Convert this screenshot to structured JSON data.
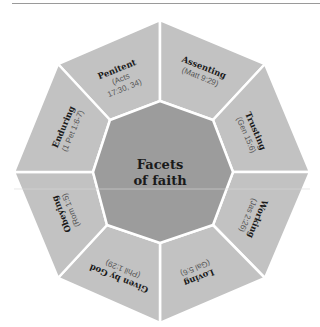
{
  "diagram": {
    "center": {
      "line1": "Facets",
      "line2": "of faith"
    },
    "colors": {
      "outer": "#c2c2c2",
      "inner": "#9c9c9c",
      "divider": "#ffffff",
      "title_text": "#1a1a1a",
      "ref_text": "#555555"
    },
    "facets": [
      {
        "title": "Penitent",
        "ref_line1": "(Acts",
        "ref_line2": "17:30, 34)"
      },
      {
        "title": "Assenting",
        "ref_line1": "(Matt 9:29)"
      },
      {
        "title": "Trusting",
        "ref_line1": "(Gen 15:6)"
      },
      {
        "title": "Working",
        "ref_line1": "(Jas 2:26)"
      },
      {
        "title": "Loving",
        "ref_line1": "(Gal 5:6)"
      },
      {
        "title": "Given by God",
        "ref_line1": "(Phil 1:29)"
      },
      {
        "title": "Obeying",
        "ref_line1": "(Rom 1:5)"
      },
      {
        "title": "Enduring",
        "ref_line1": "(1 Pet 1:6-7)"
      }
    ]
  }
}
